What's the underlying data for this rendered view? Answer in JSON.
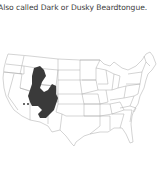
{
  "caption": {
    "text": "Also called Dark or Dusky Beardtongue."
  },
  "map": {
    "label": "Distribution range map of the United States",
    "region": "United States",
    "range_color": "#3a3a3a",
    "outline_color": "#9a9a9a",
    "background_color": "#ffffff"
  }
}
